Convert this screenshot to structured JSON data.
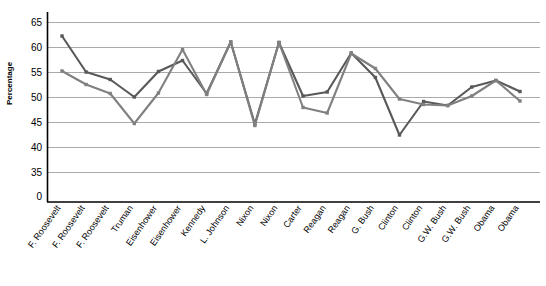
{
  "chart_data": {
    "type": "line",
    "title": "",
    "xlabel": "",
    "ylabel": "Percentage",
    "ylim": [
      0,
      67
    ],
    "grid": true,
    "legend": "none",
    "axis_break": true,
    "ytick_labels": [
      "0",
      "35",
      "40",
      "45",
      "50",
      "55",
      "60",
      "65"
    ],
    "ytick_values": [
      0,
      35,
      40,
      45,
      50,
      55,
      60,
      65
    ],
    "categories": [
      "F. Roosevelt",
      "F. Roosevelt",
      "F. Roosevelt",
      "Truman",
      "Eisenhower",
      "Eisenhower",
      "Kennedy",
      "L. Johnson",
      "Nixon",
      "Nixon",
      "Carter",
      "Reagan",
      "Reagan",
      "G. Bush",
      "Clinton",
      "Clinton",
      "G.W. Bush",
      "G.W. Bush",
      "Obama",
      "Obama"
    ],
    "series": [
      {
        "name": "Series 1",
        "color": "#595959",
        "values": [
          62.3,
          55.1,
          53.6,
          50.1,
          55.2,
          57.4,
          50.8,
          61.1,
          44.7,
          61.0,
          50.3,
          51.1,
          58.9,
          54.0,
          42.5,
          49.2,
          48.4,
          52.1,
          53.4,
          51.2
        ]
      },
      {
        "name": "Series 2",
        "color": "#808080",
        "values": [
          55.3,
          52.6,
          50.8,
          44.8,
          50.9,
          59.6,
          50.6,
          61.1,
          44.4,
          61.0,
          48.0,
          46.9,
          58.8,
          55.8,
          49.7,
          48.6,
          48.4,
          50.3,
          53.4,
          49.3
        ]
      }
    ]
  },
  "axes": {
    "axis_color": "#000000",
    "grid_color": "#aaaaaa"
  }
}
